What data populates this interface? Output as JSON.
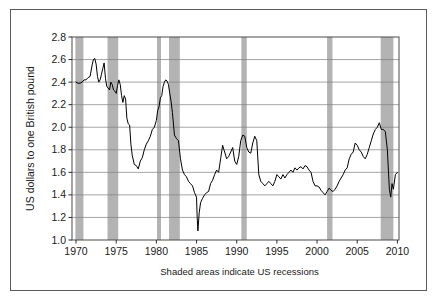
{
  "figure": {
    "background": "#ffffff",
    "border_color": "#5a5a5a",
    "caption": "Shaded areas indicate US recessions"
  },
  "chart_data": {
    "type": "line",
    "title": "",
    "xlabel": "",
    "ylabel": "US dollars to one British pound",
    "xlim": [
      1969.5,
      2010.2
    ],
    "ylim": [
      1.0,
      2.8
    ],
    "xticks": [
      1970,
      1975,
      1980,
      1985,
      1990,
      1995,
      2000,
      2005,
      2010
    ],
    "xtick_labels": [
      "1970",
      "1975",
      "1980",
      "1985",
      "1990",
      "1995",
      "2000",
      "2005",
      "2010"
    ],
    "yticks": [
      1.0,
      1.2,
      1.4,
      1.6,
      1.8,
      2.0,
      2.2,
      2.4,
      2.6,
      2.8
    ],
    "ytick_labels": [
      "1.0",
      "1.2",
      "1.4",
      "1.6",
      "1.8",
      "2.0",
      "2.2",
      "2.4",
      "2.6",
      "2.8"
    ],
    "grid": "horizontal",
    "grid_color": "#808080",
    "legend": "none",
    "line_color": "#000000",
    "line_width": 1.0,
    "shade_color": "#b3b3b3",
    "shaded_regions_label": "US recessions",
    "shaded_regions": [
      {
        "start": 1969.92,
        "end": 1970.92
      },
      {
        "start": 1973.92,
        "end": 1975.25
      },
      {
        "start": 1980.08,
        "end": 1980.58
      },
      {
        "start": 1981.58,
        "end": 1982.92
      },
      {
        "start": 1990.58,
        "end": 1991.25
      },
      {
        "start": 2001.25,
        "end": 2001.92
      },
      {
        "start": 2007.92,
        "end": 2009.5
      }
    ],
    "series": [
      {
        "name": "USD per GBP",
        "x": [
          1970.0,
          1970.25,
          1970.5,
          1970.75,
          1971.0,
          1971.25,
          1971.5,
          1971.75,
          1972.0,
          1972.17,
          1972.33,
          1972.5,
          1972.67,
          1972.83,
          1973.0,
          1973.17,
          1973.33,
          1973.5,
          1973.67,
          1973.83,
          1974.0,
          1974.17,
          1974.33,
          1974.5,
          1974.67,
          1974.83,
          1975.0,
          1975.17,
          1975.33,
          1975.5,
          1975.67,
          1975.83,
          1976.0,
          1976.17,
          1976.33,
          1976.5,
          1976.67,
          1976.83,
          1977.0,
          1977.25,
          1977.5,
          1977.75,
          1978.0,
          1978.25,
          1978.5,
          1978.75,
          1979.0,
          1979.25,
          1979.5,
          1979.75,
          1980.0,
          1980.17,
          1980.33,
          1980.5,
          1980.67,
          1980.83,
          1981.0,
          1981.17,
          1981.33,
          1981.5,
          1981.67,
          1981.83,
          1982.0,
          1982.25,
          1982.5,
          1982.75,
          1983.0,
          1983.25,
          1983.5,
          1983.75,
          1984.0,
          1984.25,
          1984.5,
          1984.75,
          1985.0,
          1985.08,
          1985.17,
          1985.33,
          1985.5,
          1985.75,
          1986.0,
          1986.25,
          1986.5,
          1986.75,
          1987.0,
          1987.25,
          1987.5,
          1987.75,
          1988.0,
          1988.25,
          1988.5,
          1988.75,
          1989.0,
          1989.25,
          1989.5,
          1989.75,
          1990.0,
          1990.25,
          1990.5,
          1990.75,
          1991.0,
          1991.25,
          1991.5,
          1991.75,
          1992.0,
          1992.25,
          1992.5,
          1992.75,
          1993.0,
          1993.25,
          1993.5,
          1993.75,
          1994.0,
          1994.25,
          1994.5,
          1994.75,
          1995.0,
          1995.25,
          1995.5,
          1995.75,
          1996.0,
          1996.25,
          1996.5,
          1996.75,
          1997.0,
          1997.25,
          1997.5,
          1997.75,
          1998.0,
          1998.25,
          1998.5,
          1998.75,
          1999.0,
          1999.25,
          1999.5,
          1999.75,
          2000.0,
          2000.25,
          2000.5,
          2000.75,
          2001.0,
          2001.25,
          2001.5,
          2001.75,
          2002.0,
          2002.25,
          2002.5,
          2002.75,
          2003.0,
          2003.25,
          2003.5,
          2003.75,
          2004.0,
          2004.25,
          2004.5,
          2004.75,
          2005.0,
          2005.25,
          2005.5,
          2005.75,
          2006.0,
          2006.25,
          2006.5,
          2006.75,
          2007.0,
          2007.25,
          2007.5,
          2007.75,
          2008.0,
          2008.25,
          2008.5,
          2008.75,
          2009.0,
          2009.17,
          2009.33,
          2009.5,
          2009.75,
          2010.0
        ],
        "y": [
          2.4,
          2.39,
          2.39,
          2.4,
          2.42,
          2.42,
          2.44,
          2.45,
          2.55,
          2.6,
          2.61,
          2.56,
          2.45,
          2.4,
          2.42,
          2.47,
          2.52,
          2.57,
          2.43,
          2.36,
          2.35,
          2.33,
          2.4,
          2.38,
          2.33,
          2.32,
          2.3,
          2.37,
          2.42,
          2.38,
          2.28,
          2.22,
          2.28,
          2.25,
          2.08,
          2.03,
          2.02,
          1.85,
          1.75,
          1.67,
          1.66,
          1.63,
          1.7,
          1.73,
          1.8,
          1.85,
          1.88,
          1.92,
          1.98,
          2.0,
          2.06,
          2.15,
          2.18,
          2.26,
          2.28,
          2.36,
          2.4,
          2.42,
          2.41,
          2.38,
          2.3,
          2.23,
          2.13,
          1.93,
          1.9,
          1.88,
          1.72,
          1.62,
          1.58,
          1.56,
          1.52,
          1.5,
          1.48,
          1.42,
          1.38,
          1.2,
          1.08,
          1.24,
          1.33,
          1.37,
          1.4,
          1.42,
          1.43,
          1.5,
          1.53,
          1.58,
          1.62,
          1.6,
          1.72,
          1.84,
          1.78,
          1.72,
          1.74,
          1.78,
          1.82,
          1.7,
          1.67,
          1.74,
          1.88,
          1.93,
          1.92,
          1.82,
          1.78,
          1.77,
          1.86,
          1.92,
          1.88,
          1.58,
          1.52,
          1.5,
          1.48,
          1.5,
          1.52,
          1.5,
          1.48,
          1.52,
          1.58,
          1.56,
          1.54,
          1.58,
          1.55,
          1.58,
          1.6,
          1.62,
          1.6,
          1.64,
          1.62,
          1.64,
          1.65,
          1.63,
          1.66,
          1.65,
          1.62,
          1.6,
          1.52,
          1.48,
          1.48,
          1.47,
          1.44,
          1.42,
          1.4,
          1.43,
          1.46,
          1.44,
          1.43,
          1.45,
          1.48,
          1.52,
          1.55,
          1.58,
          1.62,
          1.64,
          1.72,
          1.76,
          1.78,
          1.86,
          1.84,
          1.8,
          1.78,
          1.74,
          1.72,
          1.76,
          1.82,
          1.88,
          1.94,
          1.98,
          2.0,
          2.04,
          1.98,
          1.98,
          1.96,
          1.8,
          1.45,
          1.38,
          1.5,
          1.45,
          1.58,
          1.6
        ],
        "units": "USD per GBP"
      }
    ],
    "annotations": [
      {
        "text": "Shaded areas indicate US recessions",
        "position": "below-axis"
      }
    ]
  },
  "geometry": {
    "plot_left": 72,
    "plot_right": 399,
    "plot_top": 37,
    "plot_bottom": 240
  }
}
